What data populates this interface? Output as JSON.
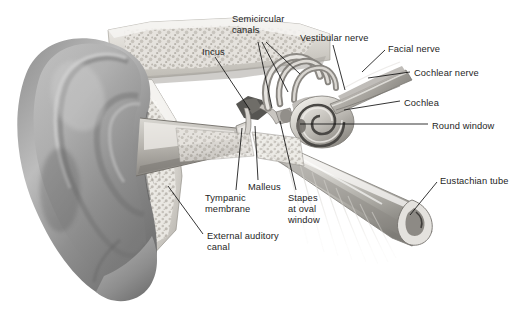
{
  "figure": {
    "background_color": "#ffffff",
    "label_color": "#1e1e1e",
    "leader_color": "#111111",
    "art_style": "grayscale airbrush medical illustration"
  },
  "labels": [
    {
      "id": "semicircular-canals",
      "text": "Semicircular\ncanals",
      "x": 232,
      "y": 14
    },
    {
      "id": "vestibular-nerve",
      "text": "Vestibular nerve",
      "x": 300,
      "y": 33
    },
    {
      "id": "facial-nerve",
      "text": "Facial nerve",
      "x": 388,
      "y": 44
    },
    {
      "id": "cochlear-nerve",
      "text": "Cochlear nerve",
      "x": 414,
      "y": 68
    },
    {
      "id": "incus",
      "text": "Incus",
      "x": 202,
      "y": 47
    },
    {
      "id": "cochlea",
      "text": "Cochlea",
      "x": 404,
      "y": 98
    },
    {
      "id": "round-window",
      "text": "Round window",
      "x": 432,
      "y": 121
    },
    {
      "id": "eustachian-tube",
      "text": "Eustachian tube",
      "x": 440,
      "y": 176
    },
    {
      "id": "malleus",
      "text": "Malleus",
      "x": 248,
      "y": 182
    },
    {
      "id": "tympanic-membrane",
      "text": "Tympanic\nmembrane",
      "x": 205,
      "y": 193
    },
    {
      "id": "stapes-at-oval-window",
      "text": "Stapes\nat oval\nwindow",
      "x": 288,
      "y": 193
    },
    {
      "id": "external-auditory-canal",
      "text": "External auditory\ncanal",
      "x": 207,
      "y": 231
    }
  ],
  "leaders": [
    {
      "id": "leader-semicircular-canals-a",
      "x1": 258,
      "y1": 42,
      "x2": 272,
      "y2": 108
    },
    {
      "id": "leader-semicircular-canals-b",
      "x1": 262,
      "y1": 42,
      "x2": 288,
      "y2": 92
    },
    {
      "id": "leader-semicircular-canals-c",
      "x1": 266,
      "y1": 42,
      "x2": 300,
      "y2": 74
    },
    {
      "id": "leader-vestibular-nerve",
      "x1": 333,
      "y1": 45,
      "x2": 345,
      "y2": 90
    },
    {
      "id": "leader-facial-nerve",
      "x1": 385,
      "y1": 50,
      "x2": 362,
      "y2": 72
    },
    {
      "id": "leader-cochlear-nerve",
      "x1": 410,
      "y1": 72,
      "x2": 368,
      "y2": 78
    },
    {
      "id": "leader-incus",
      "x1": 215,
      "y1": 57,
      "x2": 250,
      "y2": 110
    },
    {
      "id": "leader-cochlea",
      "x1": 400,
      "y1": 101,
      "x2": 344,
      "y2": 110
    },
    {
      "id": "leader-round-window",
      "x1": 428,
      "y1": 124,
      "x2": 300,
      "y2": 124
    },
    {
      "id": "leader-eustachian-tube",
      "x1": 437,
      "y1": 182,
      "x2": 410,
      "y2": 215
    },
    {
      "id": "leader-malleus",
      "x1": 258,
      "y1": 180,
      "x2": 255,
      "y2": 126
    },
    {
      "id": "leader-tympanic-membrane",
      "x1": 236,
      "y1": 190,
      "x2": 242,
      "y2": 128
    },
    {
      "id": "leader-stapes",
      "x1": 296,
      "y1": 190,
      "x2": 280,
      "y2": 121
    },
    {
      "id": "leader-external-auditory-canal",
      "x1": 203,
      "y1": 234,
      "x2": 168,
      "y2": 186
    }
  ]
}
